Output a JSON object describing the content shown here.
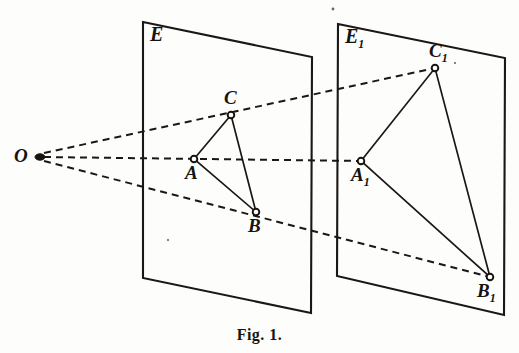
{
  "figure": {
    "caption": "Fig. 1.",
    "background_color": "#fdfdfc",
    "ink_color": "#17140f"
  },
  "labels": {
    "plane_left": "E",
    "plane_right_main": "E",
    "plane_right_sub": "1",
    "center": "O",
    "a": "A",
    "b": "B",
    "c": "C",
    "a1_main": "A",
    "a1_sub": "1",
    "b1_main": "B",
    "b1_sub": "1",
    "c1_main": "C",
    "c1_sub": "1"
  },
  "geometry": {
    "center_point": {
      "name": "O",
      "x": 33,
      "y": 157
    },
    "plane_left": {
      "name": "E",
      "corners": [
        {
          "x": 143,
          "y": 22
        },
        {
          "x": 312,
          "y": 57
        },
        {
          "x": 311,
          "y": 313
        },
        {
          "x": 143,
          "y": 278
        }
      ],
      "label_pos": {
        "x": 152,
        "y": 24
      }
    },
    "plane_right": {
      "name": "E1",
      "corners": [
        {
          "x": 338,
          "y": 24
        },
        {
          "x": 505,
          "y": 58
        },
        {
          "x": 504,
          "y": 315
        },
        {
          "x": 337,
          "y": 276
        }
      ],
      "label_pos": {
        "x": 347,
        "y": 26
      }
    },
    "triangle_left": {
      "vertices": [
        {
          "name": "A",
          "x": 194,
          "y": 159,
          "label_pos": {
            "x": 186,
            "y": 164
          }
        },
        {
          "name": "B",
          "x": 256,
          "y": 212,
          "label_pos": {
            "x": 249,
            "y": 217
          }
        },
        {
          "name": "C",
          "x": 231,
          "y": 115,
          "label_pos": {
            "x": 224,
            "y": 89
          }
        }
      ]
    },
    "triangle_right": {
      "vertices": [
        {
          "name": "A1",
          "x": 361,
          "y": 161,
          "label_pos": {
            "x": 352,
            "y": 166
          }
        },
        {
          "name": "B1",
          "x": 490,
          "y": 277,
          "label_pos": {
            "x": 478,
            "y": 281
          }
        },
        {
          "name": "C1",
          "x": 435,
          "y": 68,
          "label_pos": {
            "x": 430,
            "y": 42
          }
        }
      ]
    },
    "rays": [
      {
        "name": "ray-O-C-C1",
        "from": "O",
        "through": "C",
        "to": "C1"
      },
      {
        "name": "ray-O-A-A1",
        "from": "O",
        "through": "A",
        "to": "A1"
      },
      {
        "name": "ray-O-B-B1",
        "from": "O",
        "through": "B",
        "to": "B1"
      }
    ]
  }
}
